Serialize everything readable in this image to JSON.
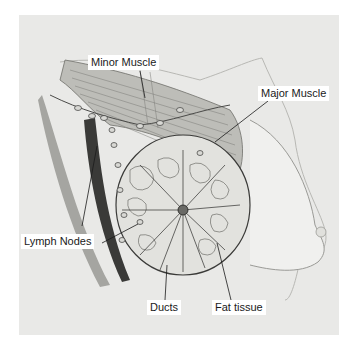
{
  "diagram": {
    "labels": [
      {
        "id": "minor-muscle",
        "text": "Minor Muscle"
      },
      {
        "id": "major-muscle",
        "text": "Major Muscle"
      },
      {
        "id": "lymph-nodes",
        "text": "Lymph Nodes"
      },
      {
        "id": "ducts",
        "text": "Ducts"
      },
      {
        "id": "fat-tissue",
        "text": "Fat tissue"
      }
    ],
    "colors": {
      "background": "#e9e9e7",
      "ink": "#2a2a2a",
      "label_bg": "#ffffff"
    }
  }
}
